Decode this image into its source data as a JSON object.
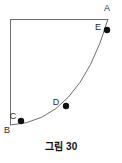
{
  "figure": {
    "caption": "그림 30",
    "stroke_color": "#6e6e6e",
    "point_color": "#101010",
    "label_color": "#2b2b2b",
    "background": "#ffffff",
    "vertices": [
      {
        "id": "A",
        "label": "A",
        "x": 108,
        "y": 19,
        "label_x": 107,
        "label_y": 11,
        "has_dot": false
      },
      {
        "id": "B",
        "label": "B",
        "x": 10,
        "y": 125,
        "label_x": 7,
        "label_y": 133,
        "has_dot": false
      }
    ],
    "curve_points": [
      {
        "id": "C",
        "label": "C",
        "x": 21,
        "y": 121,
        "label_x": 13,
        "label_y": 119,
        "has_dot": true
      },
      {
        "id": "D",
        "label": "D",
        "x": 66,
        "y": 106,
        "label_x": 56,
        "label_y": 105,
        "has_dot": true
      },
      {
        "id": "E",
        "label": "E",
        "x": 107,
        "y": 30,
        "label_x": 98,
        "label_y": 30,
        "has_dot": true
      }
    ],
    "edges": [
      {
        "id": "top-edge",
        "from": "B-top",
        "x1": 10,
        "y1": 19,
        "x2": 108,
        "y2": 19
      },
      {
        "id": "left-edge",
        "from": "B",
        "x1": 10,
        "y1": 19,
        "x2": 10,
        "y2": 125
      }
    ],
    "arc": {
      "id": "arc-B-to-A",
      "start_x": 10,
      "start_y": 125,
      "end_x": 108,
      "end_y": 19,
      "control_x": 78,
      "control_y": 122,
      "description": "concave arc from B to A through C, D, E"
    },
    "dot_radius": 3.2
  }
}
